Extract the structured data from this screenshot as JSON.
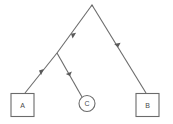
{
  "diagram": {
    "type": "directed-tree",
    "background_color": "#ffffff",
    "line_color": "#6b6b6b",
    "label_color": "#4a4a4a",
    "nodes": [
      {
        "id": "root",
        "shape": "point",
        "label": "",
        "x": 92,
        "y": 5
      },
      {
        "id": "junction",
        "shape": "point",
        "label": "",
        "x": 57,
        "y": 53
      },
      {
        "id": "A",
        "shape": "rect",
        "label": "A",
        "x": 22,
        "y": 105,
        "width": 23,
        "height": 23
      },
      {
        "id": "C",
        "shape": "circle",
        "label": "C",
        "x": 87,
        "y": 103,
        "radius": 8
      },
      {
        "id": "B",
        "shape": "rect",
        "label": "B",
        "x": 147,
        "y": 105,
        "width": 23,
        "height": 23
      }
    ],
    "edges": [
      {
        "id": "root-to-junction",
        "from": "root",
        "to": "junction",
        "x1": 92,
        "y1": 5,
        "x2": 57,
        "y2": 53,
        "arrow": "mid",
        "arrow_x": 71,
        "arrow_y": 33.8
      },
      {
        "id": "root-to-B",
        "from": "root",
        "to": "B",
        "x1": 92,
        "y1": 5,
        "x2": 146,
        "y2": 93,
        "arrow": "mid",
        "arrow_x": 118,
        "arrow_y": 47.4
      },
      {
        "id": "junction-to-A",
        "from": "junction",
        "to": "A",
        "x1": 57,
        "y1": 53,
        "x2": 25,
        "y2": 93,
        "arrow": "mid",
        "arrow_x": 39,
        "arrow_y": 70.5
      },
      {
        "id": "junction-to-C",
        "from": "junction",
        "to": "C",
        "x1": 57,
        "y1": 53,
        "x2": 82,
        "y2": 97,
        "arrow": "mid",
        "arrow_x": 70,
        "arrow_y": 75.9
      }
    ]
  }
}
